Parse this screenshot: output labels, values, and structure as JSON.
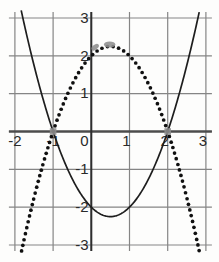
{
  "figure": {
    "width": 219,
    "height": 262,
    "bg": "#fdfdfc"
  },
  "style": {
    "grid_color": "#858585",
    "grid_width": 1.2,
    "xaxis_color": "#4c4c4c",
    "xaxis_width": 2.6,
    "yaxis_color": "#2e2e2e",
    "yaxis_width": 2.0,
    "label_color": "#2a2a2a",
    "label_size": 15,
    "curve_color": "#1e1e1e",
    "curve_width": 1.7,
    "dot_color": "#101010",
    "dot_radius": 1.85,
    "dot_spacing": 5.6,
    "marker_color": "#8e8e8e",
    "marker_opacity": 0.88,
    "overhang": 6
  },
  "axes": {
    "xmin": -2,
    "xmax": 3,
    "ymin": -3,
    "ymax": 3,
    "origin_px": [
      91.3,
      131.5
    ],
    "unit_px": [
      38.2,
      37.83
    ],
    "x_tick_labels": [
      {
        "v": -2,
        "t": "-2",
        "dx": 0
      },
      {
        "v": -1,
        "t": "-1",
        "dx": 0
      },
      {
        "v": 0,
        "t": "0",
        "dx": -7
      },
      {
        "v": 1,
        "t": "1",
        "dx": -3
      },
      {
        "v": 2,
        "t": "2",
        "dx": -3
      },
      {
        "v": 3,
        "t": "3",
        "dx": -3
      }
    ],
    "x_label_dy": 14.5,
    "y_tick_labels": [
      {
        "v": 3,
        "t": "3"
      },
      {
        "v": 2,
        "t": "2"
      },
      {
        "v": 1,
        "t": "1"
      },
      {
        "v": -1,
        "t": "-1"
      },
      {
        "v": -2,
        "t": "-2"
      },
      {
        "v": -3,
        "t": "-3"
      }
    ],
    "y_label_right": 88.5,
    "y_label_dy": 4.8
  },
  "curves": [
    {
      "name": "solid-parabola",
      "a": 1,
      "b": -1,
      "c": -2,
      "x_start": -1.835,
      "x_end": 2.835,
      "style": "solid"
    },
    {
      "name": "dotted-parabola",
      "a": -1,
      "b": 1,
      "c": 2,
      "x_start": -1.825,
      "x_end": 2.825,
      "style": "dots"
    }
  ],
  "markers": [
    {
      "shape": "square",
      "x": -1,
      "y": 0,
      "size": 6.6
    },
    {
      "shape": "square",
      "x": 2,
      "y": 0,
      "size": 6.6
    },
    {
      "shape": "ellipse",
      "x": 0.1,
      "y": 2.23,
      "rx": 4.3,
      "ry": 2.5,
      "rot": -38
    },
    {
      "shape": "ellipse",
      "x": 0.48,
      "y": 2.3,
      "rx": 5.7,
      "ry": 3.1,
      "rot": 0
    }
  ],
  "chart_data": {
    "type": "line",
    "title": "",
    "xlabel": "",
    "ylabel": "",
    "xlim": [
      -2,
      3
    ],
    "ylim": [
      -3,
      3
    ],
    "grid": true,
    "series": [
      {
        "name": "solid-parabola",
        "equation": "y = x^2 - x - 2",
        "style": "solid",
        "points": [
          [
            -2,
            4
          ],
          [
            -1,
            0
          ],
          [
            0,
            -2
          ],
          [
            0.5,
            -2.25
          ],
          [
            1,
            -2
          ],
          [
            2,
            0
          ],
          [
            3,
            4
          ]
        ]
      },
      {
        "name": "dotted-parabola",
        "equation": "y = -x^2 + x + 2",
        "style": "dotted",
        "points": [
          [
            -2,
            -4
          ],
          [
            -1,
            0
          ],
          [
            0,
            2
          ],
          [
            0.5,
            2.25
          ],
          [
            1,
            2
          ],
          [
            2,
            0
          ],
          [
            3,
            -4
          ]
        ]
      }
    ],
    "highlighted_points": [
      [
        -1,
        0
      ],
      [
        2,
        0
      ],
      [
        0,
        2
      ],
      [
        0.5,
        2.25
      ]
    ],
    "x_tick_labels": [
      "-2",
      "-1",
      "0",
      "1",
      "2",
      "3"
    ],
    "y_tick_labels": [
      "3",
      "2",
      "1",
      "-1",
      "-2",
      "-3"
    ]
  }
}
